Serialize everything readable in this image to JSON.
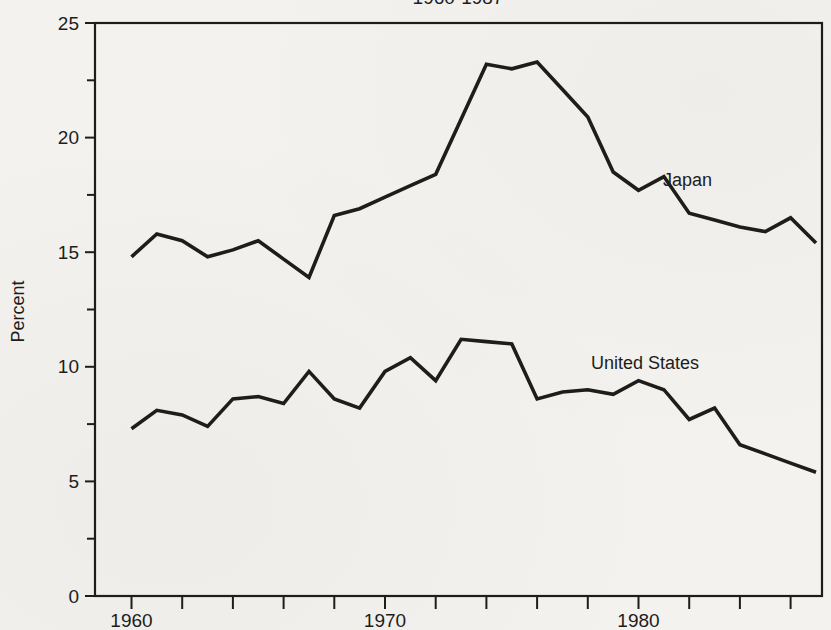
{
  "chart_data": {
    "type": "line",
    "title": "1960-1987",
    "ylabel": "Percent",
    "xlabel": "",
    "ylim": [
      0,
      25
    ],
    "y_major_ticks": [
      0,
      5,
      10,
      15,
      20,
      25
    ],
    "y_minor_step": 2.5,
    "x_range": [
      1960,
      1987
    ],
    "x_tick_step_years": 2,
    "x_labeled_ticks": [
      "1960",
      "1970",
      "1980"
    ],
    "grid": "off",
    "legend": "inline-labels",
    "years": [
      1960,
      1961,
      1962,
      1963,
      1964,
      1965,
      1966,
      1967,
      1968,
      1969,
      1970,
      1971,
      1972,
      1973,
      1974,
      1975,
      1976,
      1977,
      1978,
      1979,
      1980,
      1981,
      1982,
      1983,
      1984,
      1985,
      1986,
      1987
    ],
    "series": [
      {
        "name": "Japan",
        "values": [
          14.8,
          15.8,
          15.5,
          14.8,
          15.1,
          15.5,
          14.7,
          13.9,
          16.6,
          16.9,
          17.4,
          17.9,
          18.4,
          20.8,
          23.2,
          23.0,
          23.3,
          22.1,
          20.9,
          18.5,
          17.7,
          18.3,
          16.7,
          16.4,
          16.1,
          15.9,
          16.5,
          15.4
        ]
      },
      {
        "name": "United States",
        "values": [
          7.3,
          8.1,
          7.9,
          7.4,
          8.6,
          8.7,
          8.4,
          9.8,
          8.6,
          8.2,
          9.8,
          10.4,
          9.4,
          11.2,
          11.1,
          11.0,
          8.6,
          8.9,
          9.0,
          8.8,
          9.4,
          9.0,
          7.7,
          8.2,
          6.6,
          6.2,
          5.8,
          5.4
        ]
      }
    ],
    "ink_color": "#1d1d1b",
    "paper_color": "#f3f2ef"
  }
}
